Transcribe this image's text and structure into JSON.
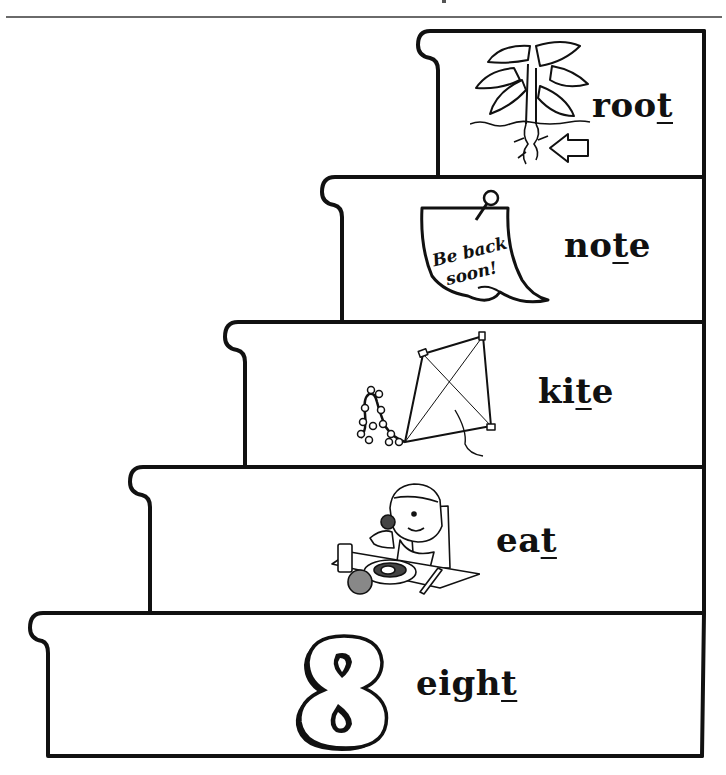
{
  "page": {
    "ink_color": "#111111",
    "background": "#ffffff"
  },
  "steps": [
    {
      "level": 1,
      "word_start": "roo",
      "word_target": "t",
      "word_end": "",
      "full_word": "root",
      "icon": "plant-root-icon",
      "picture_text": ""
    },
    {
      "level": 2,
      "word_start": "no",
      "word_target": "t",
      "word_end": "e",
      "full_word": "note",
      "icon": "sticky-note-icon",
      "picture_text": "Be back soon!"
    },
    {
      "level": 3,
      "word_start": "ki",
      "word_target": "t",
      "word_end": "e",
      "full_word": "kite",
      "icon": "kite-icon",
      "picture_text": ""
    },
    {
      "level": 4,
      "word_start": "ea",
      "word_target": "t",
      "word_end": "",
      "full_word": "eat",
      "icon": "boy-eating-icon",
      "picture_text": ""
    },
    {
      "level": 5,
      "word_start": "eigh",
      "word_target": "t",
      "word_end": "",
      "full_word": "eight",
      "icon": "number-eight-icon",
      "picture_text": "8"
    }
  ]
}
